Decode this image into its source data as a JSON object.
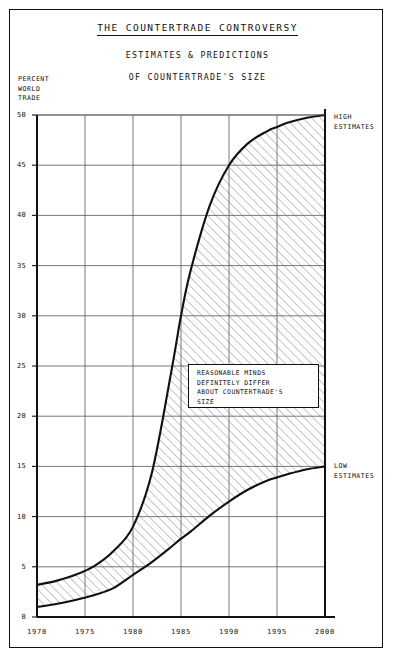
{
  "title": "THE COUNTERTRADE CONTROVERSY",
  "subtitle_line1": "ESTIMATES & PREDICTIONS",
  "subtitle_line2": "OF COUNTERTRADE'S SIZE",
  "y_axis_caption": "PERCENT\nWORLD\nTRADE",
  "annotation": "REASONABLE MINDS\nDEFINITELY DIFFER\nABOUT COUNTERTRADE'S\nSIZE",
  "callouts": {
    "high": "HIGH\nESTIMATES",
    "low": "LOW\nESTIMATES"
  },
  "colors": {
    "ink": "#111111",
    "grid": "#555555",
    "hatch": "#777777",
    "paper": "#ffffff"
  },
  "chart_data": {
    "type": "area",
    "title": "THE COUNTERTRADE CONTROVERSY",
    "subtitle": "ESTIMATES & PREDICTIONS OF COUNTERTRADE'S SIZE",
    "xlabel": "",
    "ylabel": "PERCENT WORLD TRADE",
    "xlim": [
      1970,
      2000
    ],
    "ylim": [
      0,
      50
    ],
    "xticks": [
      1970,
      1975,
      1980,
      1985,
      1990,
      1995,
      2000
    ],
    "yticks": [
      0,
      5,
      10,
      15,
      20,
      25,
      30,
      35,
      40,
      45,
      50
    ],
    "grid": true,
    "legend_position": "right-inline-callouts",
    "x": [
      1970,
      1972,
      1974,
      1976,
      1978,
      1980,
      1982,
      1984,
      1985,
      1986,
      1988,
      1990,
      1992,
      1994,
      1995,
      1996,
      1998,
      2000
    ],
    "series": [
      {
        "name": "HIGH ESTIMATES",
        "values": [
          3.2,
          3.6,
          4.2,
          5.1,
          6.6,
          9.0,
          14.5,
          24.5,
          30.0,
          34.5,
          41.0,
          45.0,
          47.2,
          48.4,
          48.8,
          49.2,
          49.7,
          50.0
        ]
      },
      {
        "name": "LOW ESTIMATES",
        "values": [
          1.0,
          1.3,
          1.7,
          2.2,
          2.9,
          4.2,
          5.5,
          7.0,
          7.8,
          8.5,
          10.1,
          11.5,
          12.7,
          13.6,
          13.9,
          14.2,
          14.7,
          15.0
        ]
      }
    ],
    "annotations": [
      {
        "text": "REASONABLE MINDS DEFINITELY DIFFER ABOUT COUNTERTRADE'S SIZE",
        "x": 1986.5,
        "y": 23.5
      }
    ],
    "shaded_region": {
      "between": [
        "LOW ESTIMATES",
        "HIGH ESTIMATES"
      ],
      "fill": "diagonal-hatch"
    }
  }
}
